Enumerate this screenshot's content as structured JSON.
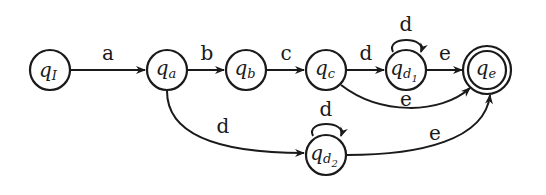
{
  "diagram": {
    "type": "finite-automaton",
    "states": [
      {
        "id": "qI",
        "label": "q",
        "sub": "I",
        "accepting": false
      },
      {
        "id": "qa",
        "label": "q",
        "sub": "a",
        "accepting": false
      },
      {
        "id": "qb",
        "label": "q",
        "sub": "b",
        "accepting": false
      },
      {
        "id": "qc",
        "label": "q",
        "sub": "c",
        "accepting": false
      },
      {
        "id": "qd1",
        "label": "q",
        "sub": "d",
        "subsub": "1",
        "accepting": false
      },
      {
        "id": "qe",
        "label": "q",
        "sub": "e",
        "accepting": true
      },
      {
        "id": "qd2",
        "label": "q",
        "sub": "d",
        "subsub": "2",
        "accepting": false
      }
    ],
    "transitions": [
      {
        "from": "qI",
        "to": "qa",
        "label": "a"
      },
      {
        "from": "qa",
        "to": "qb",
        "label": "b"
      },
      {
        "from": "qb",
        "to": "qc",
        "label": "c"
      },
      {
        "from": "qc",
        "to": "qd1",
        "label": "d"
      },
      {
        "from": "qd1",
        "to": "qd1",
        "label": "d"
      },
      {
        "from": "qd1",
        "to": "qe",
        "label": "e"
      },
      {
        "from": "qc",
        "to": "qe",
        "label": "e"
      },
      {
        "from": "qa",
        "to": "qd2",
        "label": "d"
      },
      {
        "from": "qd2",
        "to": "qd2",
        "label": "d"
      },
      {
        "from": "qd2",
        "to": "qe",
        "label": "e"
      }
    ]
  }
}
